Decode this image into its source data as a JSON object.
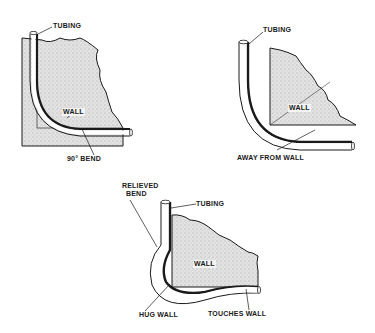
{
  "diagrams": [
    {
      "id": "ninety-degree-bend",
      "labels": {
        "tubing": "TUBING",
        "wall": "WALL",
        "bend": "90° BEND"
      }
    },
    {
      "id": "away-from-wall",
      "labels": {
        "tubing": "TUBING",
        "wall": "WALL",
        "note": "AWAY FROM WALL"
      }
    },
    {
      "id": "relieved-bend",
      "labels": {
        "relieved_line1": "RELIEVED",
        "relieved_line2": "BEND",
        "tubing": "TUBING",
        "wall": "WALL",
        "hug": "HUG WALL",
        "touches": "TOUCHES WALL"
      }
    }
  ],
  "colors": {
    "ink": "#1a1a1a",
    "wall_fill": "#dcdcdc",
    "background": "#ffffff"
  }
}
